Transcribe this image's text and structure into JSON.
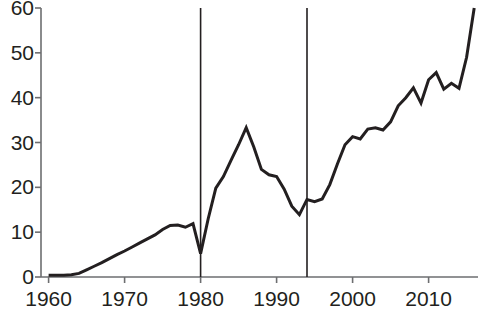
{
  "chart_data": {
    "type": "line",
    "title": "",
    "subtitle": "",
    "xlabel": "",
    "ylabel": "",
    "xlim": [
      1959,
      2016.5
    ],
    "ylim": [
      0,
      60
    ],
    "grid": false,
    "legend": null,
    "axis_color": "#6d6e70",
    "line_color": "#231f20",
    "line_width": 3.0,
    "marker_line_color": "#231f20",
    "marker_line_width": 1.6,
    "xticks": [
      1960,
      1970,
      1980,
      1990,
      2000,
      2010
    ],
    "xtick_labels": [
      "1960",
      "1970",
      "1980",
      "1990",
      "2000",
      "2010"
    ],
    "yticks": [
      0,
      10,
      20,
      30,
      40,
      50,
      60
    ],
    "ytick_labels": [
      "0",
      "10",
      "20",
      "30",
      "40",
      "50",
      "60"
    ],
    "annotations": [
      {
        "type": "vline",
        "x": 1980,
        "label": ""
      },
      {
        "type": "vline",
        "x": 1994,
        "label": ""
      }
    ],
    "x": [
      1960,
      1961,
      1962,
      1963,
      1964,
      1965,
      1966,
      1967,
      1968,
      1969,
      1970,
      1971,
      1972,
      1973,
      1974,
      1975,
      1976,
      1977,
      1978,
      1979,
      1980,
      1981,
      1982,
      1983,
      1984,
      1985,
      1986,
      1987,
      1988,
      1989,
      1990,
      1991,
      1992,
      1993,
      1994,
      1995,
      1996,
      1997,
      1998,
      1999,
      2000,
      2001,
      2002,
      2003,
      2004,
      2005,
      2006,
      2007,
      2008,
      2009,
      2010,
      2011,
      2012,
      2013,
      2014,
      2015,
      2016
    ],
    "values": [
      0.4,
      0.4,
      0.4,
      0.5,
      0.8,
      1.6,
      2.4,
      3.2,
      4.1,
      5.0,
      5.8,
      6.7,
      7.6,
      8.5,
      9.4,
      10.6,
      11.5,
      11.6,
      11.1,
      11.9,
      5.2,
      13.0,
      19.8,
      22.4,
      26.0,
      29.5,
      33.3,
      29.0,
      24.0,
      22.8,
      22.4,
      19.6,
      15.8,
      13.9,
      17.3,
      16.8,
      17.4,
      20.6,
      25.2,
      29.5,
      31.3,
      30.8,
      33.0,
      33.3,
      32.8,
      34.6,
      38.2,
      40.0,
      42.2,
      38.8,
      44.0,
      45.6,
      41.9,
      43.2,
      42.1,
      49.0,
      60.0
    ]
  },
  "axes": {
    "y_axis_name": "value-axis",
    "x_axis_name": "year-axis"
  }
}
